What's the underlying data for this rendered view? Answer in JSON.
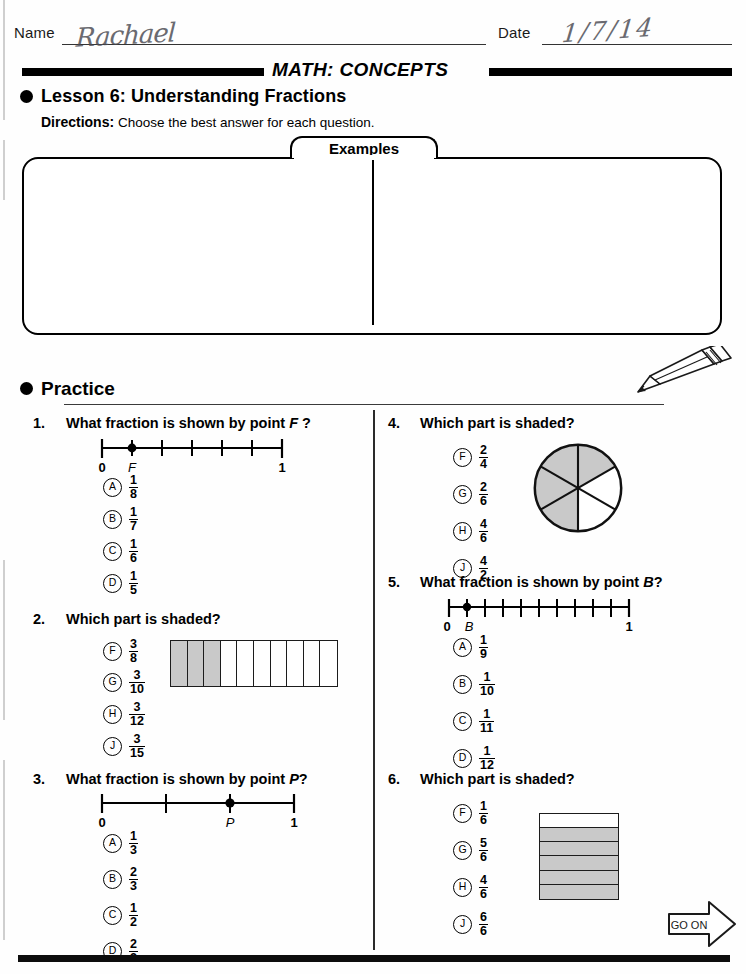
{
  "header": {
    "name_label": "Name",
    "name_value": "Rachael",
    "date_label": "Date",
    "date_value": "1/7/14"
  },
  "band": {
    "title": "MATH: CONCEPTS"
  },
  "lesson": {
    "title": "Lesson 6: Understanding Fractions",
    "directions_label": "Directions:",
    "directions_text": "Choose the best answer for each question."
  },
  "examples": {
    "tab_label": "Examples",
    "items": [
      {
        "num": "A.",
        "text": "Which part is shaded?",
        "figure": "bar-4-cells-3-shaded",
        "choices": [
          {
            "letter": "A",
            "num": "3",
            "den": "1"
          },
          {
            "letter": "B",
            "num": "1",
            "den": "3"
          },
          {
            "letter": "C",
            "num": "3",
            "den": "4"
          },
          {
            "letter": "D",
            "num": "1",
            "den": "4"
          }
        ]
      },
      {
        "num": "B.",
        "text_pre": "What fraction is shown by point ",
        "text_point": "A",
        "text_post": "?",
        "figure": "numberline-8-point-at-3",
        "line_start": "0",
        "line_end": "1",
        "point_label": "A",
        "choices": [
          {
            "letter": "F",
            "num": "1",
            "den": "8"
          },
          {
            "letter": "G",
            "num": "1",
            "den": "7"
          },
          {
            "letter": "H",
            "num": "3",
            "den": "8"
          },
          {
            "letter": "J",
            "num": "3",
            "den": "7"
          }
        ]
      }
    ]
  },
  "practice": {
    "title": "Practice",
    "go_on_label": "GO ON",
    "questions": [
      {
        "num": "1.",
        "text_pre": "What fraction is shown by point ",
        "text_point": "F",
        "text_post": " ?",
        "figure": "numberline-6-point-at-1",
        "line_start": "0",
        "line_end": "1",
        "point_label": "F",
        "choices": [
          {
            "letter": "A",
            "num": "1",
            "den": "8"
          },
          {
            "letter": "B",
            "num": "1",
            "den": "7"
          },
          {
            "letter": "C",
            "num": "1",
            "den": "6"
          },
          {
            "letter": "D",
            "num": "1",
            "den": "5"
          }
        ]
      },
      {
        "num": "2.",
        "text_pre": "Which part is shaded?",
        "text_point": "",
        "text_post": "",
        "figure": "bar-10-cells-3-shaded",
        "choices": [
          {
            "letter": "F",
            "num": "3",
            "den": "8"
          },
          {
            "letter": "G",
            "num": "3",
            "den": "10"
          },
          {
            "letter": "H",
            "num": "3",
            "den": "12"
          },
          {
            "letter": "J",
            "num": "3",
            "den": "15"
          }
        ]
      },
      {
        "num": "3.",
        "text_pre": "What fraction is shown by point ",
        "text_point": "P",
        "text_post": "?",
        "figure": "numberline-3-point-at-2",
        "line_start": "0",
        "line_end": "1",
        "point_label": "P",
        "choices": [
          {
            "letter": "A",
            "num": "1",
            "den": "3"
          },
          {
            "letter": "B",
            "num": "2",
            "den": "3"
          },
          {
            "letter": "C",
            "num": "1",
            "den": "2"
          },
          {
            "letter": "D",
            "num": "2",
            "den": "2"
          }
        ]
      },
      {
        "num": "4.",
        "text_pre": "Which part is shaded?",
        "text_point": "",
        "text_post": "",
        "figure": "circle-6-sectors-4-shaded",
        "choices": [
          {
            "letter": "F",
            "num": "2",
            "den": "4"
          },
          {
            "letter": "G",
            "num": "2",
            "den": "6"
          },
          {
            "letter": "H",
            "num": "4",
            "den": "6"
          },
          {
            "letter": "J",
            "num": "4",
            "den": "2"
          }
        ]
      },
      {
        "num": "5.",
        "text_pre": "What fraction is shown by point ",
        "text_point": "B",
        "text_post": "?",
        "figure": "numberline-10-point-at-1",
        "line_start": "0",
        "line_end": "1",
        "point_label": "B",
        "choices": [
          {
            "letter": "A",
            "num": "1",
            "den": "9"
          },
          {
            "letter": "B",
            "num": "1",
            "den": "10"
          },
          {
            "letter": "C",
            "num": "1",
            "den": "11"
          },
          {
            "letter": "D",
            "num": "1",
            "den": "12"
          }
        ]
      },
      {
        "num": "6.",
        "text_pre": "Which part is shaded?",
        "text_point": "",
        "text_post": "",
        "figure": "rows-6-5-shaded",
        "choices": [
          {
            "letter": "F",
            "num": "1",
            "den": "6"
          },
          {
            "letter": "G",
            "num": "5",
            "den": "6"
          },
          {
            "letter": "H",
            "num": "4",
            "den": "6"
          },
          {
            "letter": "J",
            "num": "6",
            "den": "6"
          }
        ]
      }
    ]
  },
  "icons": {
    "pencil": "pencil-icon",
    "go_on_arrow": "arrow-right-icon",
    "bullet": "bullet-dot-icon"
  },
  "colors": {
    "ink": "#000000",
    "shade": "#c9c9c9",
    "handwriting": "#4a4a52"
  }
}
